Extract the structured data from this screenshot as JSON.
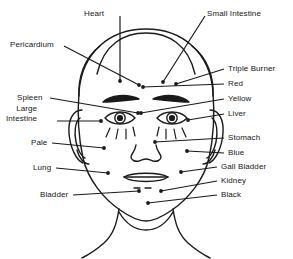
{
  "diagram": {
    "line_color": "#1a1a1a",
    "background_color": "#ffffff",
    "label_text_color": "#161616",
    "labels_left": [
      {
        "id": "heart",
        "text": "Heart",
        "x": 84,
        "y": 9,
        "anchor_x": 120,
        "anchor_y": 16,
        "point_x": 120,
        "point_y": 81
      },
      {
        "id": "pericardium",
        "text": "Pericardium",
        "x": 10,
        "y": 40,
        "anchor_x": 64,
        "anchor_y": 46,
        "point_x": 139,
        "point_y": 85
      },
      {
        "id": "spleen",
        "text": "Spleen",
        "x": 17,
        "y": 93,
        "anchor_x": 50,
        "anchor_y": 98,
        "point_x": 138,
        "point_y": 113
      },
      {
        "id": "large-intestine",
        "text": "Large\nIntestine",
        "x": 6,
        "y": 104,
        "anchor_x": 57,
        "anchor_y": 121,
        "point_x": 101,
        "point_y": 121
      },
      {
        "id": "pale",
        "text": "Pale",
        "x": 31,
        "y": 138,
        "anchor_x": 52,
        "anchor_y": 143,
        "point_x": 104,
        "point_y": 148
      },
      {
        "id": "lung",
        "text": "Lung",
        "x": 33,
        "y": 163,
        "anchor_x": 56,
        "anchor_y": 168,
        "point_x": 108,
        "point_y": 173
      },
      {
        "id": "bladder",
        "text": "Bladder",
        "x": 40,
        "y": 190,
        "anchor_x": 73,
        "anchor_y": 195,
        "point_x": 139,
        "point_y": 191
      }
    ],
    "labels_right": [
      {
        "id": "small-intestine",
        "text": "Small Intestine",
        "x": 207,
        "y": 9,
        "anchor_x": 205,
        "anchor_y": 16,
        "point_x": 163,
        "point_y": 82
      },
      {
        "id": "triple-burner",
        "text": "Triple Burner",
        "x": 228,
        "y": 64,
        "anchor_x": 224,
        "anchor_y": 69,
        "point_x": 176,
        "point_y": 84
      },
      {
        "id": "red",
        "text": "Red",
        "x": 228,
        "y": 79,
        "anchor_x": 224,
        "anchor_y": 84,
        "point_x": 143,
        "point_y": 87
      },
      {
        "id": "yellow",
        "text": "Yellow",
        "x": 228,
        "y": 94,
        "anchor_x": 224,
        "anchor_y": 99,
        "point_x": 141,
        "point_y": 113
      },
      {
        "id": "liver",
        "text": "Liver",
        "x": 228,
        "y": 109,
        "anchor_x": 224,
        "anchor_y": 114,
        "point_x": 188,
        "point_y": 120
      },
      {
        "id": "stomach",
        "text": "Stomach",
        "x": 228,
        "y": 133,
        "anchor_x": 224,
        "anchor_y": 138,
        "point_x": 155,
        "point_y": 142
      },
      {
        "id": "blue",
        "text": "Blue",
        "x": 228,
        "y": 148,
        "anchor_x": 224,
        "anchor_y": 153,
        "point_x": 187,
        "point_y": 151
      },
      {
        "id": "gall-bladder",
        "text": "Gall Bladder",
        "x": 221,
        "y": 162,
        "anchor_x": 217,
        "anchor_y": 167,
        "point_x": 181,
        "point_y": 172
      },
      {
        "id": "kidney",
        "text": "Kidney",
        "x": 221,
        "y": 176,
        "anchor_x": 217,
        "anchor_y": 181,
        "point_x": 161,
        "point_y": 191
      },
      {
        "id": "black",
        "text": "Black",
        "x": 221,
        "y": 190,
        "anchor_x": 217,
        "anchor_y": 195,
        "point_x": 148,
        "point_y": 203
      }
    ]
  }
}
